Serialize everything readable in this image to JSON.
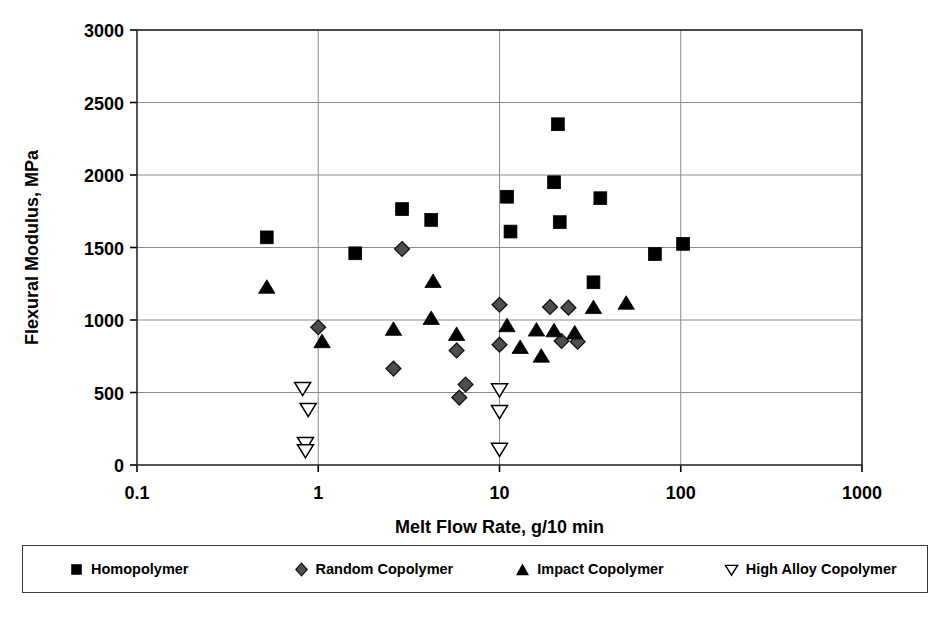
{
  "chart_data": {
    "type": "scatter",
    "title": "",
    "xlabel": "Melt Flow Rate, g/10 min",
    "ylabel": "Flexural Modulus, MPa",
    "xscale": "log",
    "xlim": [
      0.1,
      1000
    ],
    "ylim": [
      0,
      3000
    ],
    "xticks": [
      "0.1",
      "1",
      "10",
      "100",
      "1000"
    ],
    "xtick_values": [
      0.1,
      1,
      10,
      100,
      1000
    ],
    "yticks": [
      "0",
      "500",
      "1000",
      "1500",
      "2000",
      "2500",
      "3000"
    ],
    "ytick_values": [
      0,
      500,
      1000,
      1500,
      2000,
      2500,
      3000
    ],
    "grid": "horizontal-and-vertical",
    "legend_position": "below-plot",
    "series": [
      {
        "name": "Homopolymer",
        "marker": "filled-square",
        "color": "#000000",
        "points": [
          [
            0.52,
            1570
          ],
          [
            1.6,
            1460
          ],
          [
            2.9,
            1765
          ],
          [
            4.2,
            1690
          ],
          [
            11.0,
            1850
          ],
          [
            11.5,
            1610
          ],
          [
            21.0,
            2350
          ],
          [
            20.0,
            1950
          ],
          [
            21.5,
            1675
          ],
          [
            36.0,
            1840
          ],
          [
            33.0,
            1260
          ],
          [
            72.0,
            1455
          ],
          [
            103.0,
            1525
          ]
        ]
      },
      {
        "name": "Random Copolymer",
        "marker": "filled-diamond",
        "color": "#4d4d4d",
        "points": [
          [
            1.0,
            950
          ],
          [
            2.9,
            1490
          ],
          [
            2.6,
            665
          ],
          [
            5.8,
            790
          ],
          [
            6.5,
            555
          ],
          [
            6.0,
            465
          ],
          [
            10.0,
            1105
          ],
          [
            10.0,
            830
          ],
          [
            19.0,
            1090
          ],
          [
            24.0,
            1085
          ],
          [
            22.0,
            855
          ],
          [
            27.0,
            850
          ]
        ]
      },
      {
        "name": "Impact Copolymer",
        "marker": "filled-triangle",
        "color": "#000000",
        "points": [
          [
            0.52,
            1225
          ],
          [
            1.05,
            850
          ],
          [
            2.6,
            935
          ],
          [
            4.3,
            1265
          ],
          [
            4.2,
            1010
          ],
          [
            5.8,
            900
          ],
          [
            11.0,
            960
          ],
          [
            13.0,
            810
          ],
          [
            16.0,
            930
          ],
          [
            17.0,
            750
          ],
          [
            20.0,
            925
          ],
          [
            26.0,
            910
          ],
          [
            33.0,
            1085
          ],
          [
            50.0,
            1115
          ]
        ]
      },
      {
        "name": "High Alloy Copolymer",
        "marker": "open-down-triangle",
        "color": "#000000",
        "points": [
          [
            0.82,
            530
          ],
          [
            0.88,
            385
          ],
          [
            0.85,
            150
          ],
          [
            0.85,
            100
          ],
          [
            10.0,
            520
          ],
          [
            10.0,
            370
          ],
          [
            10.0,
            110
          ]
        ]
      }
    ]
  },
  "legend": {
    "items": [
      {
        "label": "Homopolymer",
        "marker": "filled-square"
      },
      {
        "label": "Random Copolymer",
        "marker": "filled-diamond"
      },
      {
        "label": "Impact Copolymer",
        "marker": "filled-triangle"
      },
      {
        "label": "High Alloy Copolymer",
        "marker": "open-down-triangle"
      }
    ]
  }
}
